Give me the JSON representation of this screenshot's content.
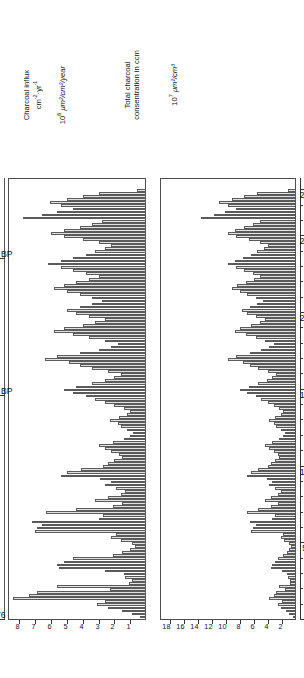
{
  "figure": {
    "orientation": "rotated-90",
    "left_panel": {
      "title_line1": "Charcoal influx",
      "title_line2": "cm",
      "title_line2_sup1": "-2",
      "title_line2_mid": "·yr",
      "title_line2_sup2": "-1",
      "units_mantissa": "10",
      "units_exponent": "6",
      "units_rest": " μm²/cm²/year"
    },
    "right_panel": {
      "title_line1": "Total charcoal",
      "title_line2": "consentration in ccm",
      "units_mantissa": "10",
      "units_exponent": "7",
      "units_rest": " μm²/cm³"
    },
    "depth_axis": {
      "label_unit": "cm",
      "ticks": [
        0,
        50,
        100,
        150,
        200,
        250,
        280
      ],
      "min": 0,
      "max": 280
    },
    "age_axis": {
      "ticks": [
        {
          "label": "1976",
          "depth": 0
        },
        {
          "label": "2000 BP",
          "depth": 146
        },
        {
          "label": "4000 BP",
          "depth": 235
        }
      ]
    }
  },
  "chart_data": {
    "type": "bar",
    "subtitle": "",
    "xlabel": "cm",
    "ylabel": "",
    "grid": false,
    "legend": null,
    "orientation": "horizontal-rotated",
    "axes": [
      {
        "name": "Charcoal influx",
        "units": "10^6 μm²/cm²/year",
        "tick_labels": [
          8,
          7,
          6,
          5,
          4,
          3,
          2,
          1
        ],
        "lim": [
          0,
          8.5
        ],
        "direction": "decreasing-right"
      },
      {
        "name": "Total charcoal consentration in ccm",
        "units": "10^7 μm²/cm³",
        "tick_labels": [
          18,
          16,
          14,
          12,
          10,
          8,
          6,
          4,
          2
        ],
        "lim": [
          0,
          19
        ],
        "direction": "decreasing-right"
      }
    ],
    "depth_ticks": [
      0,
      50,
      100,
      150,
      200,
      250,
      280
    ],
    "depth_minor_step": 10,
    "depth": [
      1,
      3,
      5,
      7,
      9,
      11,
      13,
      15,
      17,
      19,
      21,
      23,
      25,
      27,
      29,
      31,
      33,
      35,
      37,
      39,
      41,
      43,
      45,
      47,
      49,
      51,
      53,
      55,
      57,
      59,
      61,
      63,
      65,
      67,
      69,
      71,
      73,
      75,
      77,
      79,
      81,
      83,
      85,
      87,
      89,
      91,
      93,
      95,
      97,
      99,
      101,
      103,
      105,
      107,
      109,
      111,
      113,
      115,
      117,
      119,
      121,
      123,
      125,
      127,
      129,
      131,
      133,
      135,
      137,
      139,
      141,
      143,
      145,
      147,
      149,
      151,
      153,
      155,
      157,
      159,
      161,
      163,
      165,
      167,
      169,
      171,
      173,
      175,
      177,
      179,
      181,
      183,
      185,
      187,
      189,
      191,
      193,
      195,
      197,
      199,
      201,
      203,
      205,
      207,
      209,
      211,
      213,
      215,
      217,
      219,
      221,
      223,
      225,
      227,
      229,
      231,
      233,
      235,
      237,
      239,
      241,
      243,
      245,
      247,
      249,
      251,
      253,
      255,
      257,
      259,
      261,
      263,
      265,
      267,
      269,
      271,
      273,
      275,
      277,
      279
    ],
    "series": [
      {
        "name": "Charcoal influx",
        "units": "10^6 μm²/cm²/year",
        "values": [
          0.35,
          0.9,
          1.5,
          2.4,
          3.1,
          2.6,
          8.4,
          7.4,
          6.9,
          2.3,
          5.6,
          1.1,
          0.9,
          1.3,
          1.4,
          2.6,
          5.5,
          5.6,
          5.2,
          4.6,
          2.1,
          1.5,
          1.0,
          0.7,
          0.9,
          1.6,
          2.2,
          1.9,
          7.0,
          6.9,
          6.6,
          7.2,
          3.0,
          2.7,
          6.3,
          4.4,
          2.1,
          1.5,
          3.2,
          2.4,
          1.6,
          1.3,
          1.9,
          2.6,
          2.2,
          2.9,
          5.4,
          5.0,
          4.1,
          2.7,
          2.4,
          2.0,
          1.5,
          1.7,
          2.2,
          2.6,
          3.0,
          2.1,
          1.4,
          1.0,
          0.8,
          1.2,
          1.6,
          1.8,
          2.3,
          1.7,
          1.2,
          1.0,
          1.4,
          2.0,
          2.6,
          3.2,
          3.8,
          4.6,
          5.2,
          4.4,
          3.4,
          2.6,
          2.0,
          1.6,
          2.4,
          3.4,
          4.2,
          4.9,
          6.4,
          5.6,
          4.2,
          3.0,
          2.2,
          1.8,
          2.6,
          3.6,
          4.6,
          5.8,
          5.2,
          4.0,
          3.2,
          2.6,
          3.6,
          4.4,
          5.0,
          4.2,
          3.4,
          2.8,
          3.4,
          4.2,
          5.0,
          5.8,
          5.2,
          4.4,
          3.6,
          3.0,
          3.8,
          4.6,
          5.4,
          6.2,
          5.4,
          4.6,
          3.8,
          3.2,
          2.6,
          2.2,
          3.0,
          4.0,
          5.2,
          6.0,
          5.2,
          4.2,
          3.4,
          2.8,
          7.8,
          6.6,
          5.6,
          4.6,
          5.4,
          6.1,
          5.0,
          4.0,
          3.0,
          0.6
        ],
        "color": "#e2e2e2"
      },
      {
        "name": "Total charcoal consentration",
        "units": "10^7 μm²/cm³",
        "values": [
          0.5,
          1.0,
          1.4,
          2.2,
          2.6,
          2.0,
          3.8,
          3.2,
          2.8,
          1.6,
          2.4,
          0.9,
          0.8,
          1.1,
          1.3,
          2.0,
          3.6,
          3.4,
          3.0,
          2.6,
          1.8,
          1.3,
          1.0,
          0.7,
          1.0,
          1.7,
          2.2,
          1.9,
          6.4,
          6.2,
          5.8,
          6.6,
          3.4,
          3.0,
          7.0,
          5.4,
          3.6,
          2.6,
          4.4,
          3.6,
          2.6,
          2.1,
          3.0,
          3.8,
          3.4,
          4.2,
          7.0,
          6.4,
          5.4,
          4.0,
          3.6,
          3.0,
          2.4,
          2.6,
          3.2,
          3.8,
          4.4,
          3.4,
          2.4,
          1.8,
          1.6,
          2.2,
          2.8,
          3.2,
          3.8,
          3.0,
          2.2,
          1.8,
          2.4,
          3.2,
          4.0,
          5.0,
          5.8,
          7.0,
          8.0,
          6.8,
          5.4,
          4.2,
          3.4,
          2.8,
          4.0,
          5.4,
          6.6,
          7.6,
          9.8,
          8.6,
          6.6,
          5.0,
          3.8,
          3.2,
          4.4,
          5.8,
          7.2,
          8.8,
          8.0,
          6.4,
          5.2,
          4.4,
          5.8,
          7.0,
          7.8,
          6.6,
          5.6,
          4.8,
          5.8,
          7.0,
          8.0,
          9.2,
          8.4,
          7.2,
          6.0,
          5.2,
          6.2,
          7.4,
          8.6,
          9.8,
          8.8,
          7.6,
          6.4,
          5.6,
          4.6,
          4.0,
          5.2,
          6.8,
          8.6,
          9.8,
          8.8,
          7.4,
          6.2,
          5.2,
          13.6,
          11.8,
          10.2,
          8.6,
          9.8,
          11.0,
          9.2,
          7.4,
          5.6,
          1.2
        ],
        "color": "#e2e2e2"
      }
    ]
  }
}
